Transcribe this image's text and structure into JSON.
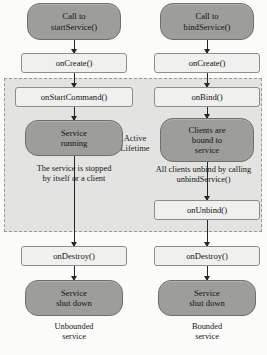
{
  "diagram": {
    "active_lifetime_label": "Active\nLifetime",
    "active_lifetime_line1": "Active",
    "active_lifetime_line2": "Lifetime",
    "colors": {
      "rounded_node_fill": "#9d9d9a",
      "rounded_node_stroke": "#6e6e6b",
      "box_node_fill": "#f0f0ee",
      "box_node_stroke": "#8d8d89",
      "panel_fill": "#e3e3e1",
      "panel_stroke": "#9a9a96",
      "arrow_color": "#262626",
      "text_color": "#151515",
      "background": "#fbfbfa"
    }
  },
  "unbounded_column": {
    "caption_line1": "Unbounded",
    "caption_line2": "service",
    "start_line1": "Call to",
    "start_line2": "startService()",
    "on_create": "onCreate()",
    "on_start_command": "onStartCommand()",
    "running_line1": "Service",
    "running_line2": "running",
    "stopped_note_line1": "The service is stopped",
    "stopped_note_line2": "by itself or a client",
    "on_destroy": "onDestroy()",
    "shutdown_line1": "Service",
    "shutdown_line2": "shut down"
  },
  "bounded_column": {
    "caption_line1": "Bounded",
    "caption_line2": "service",
    "start_line1": "Call to",
    "start_line2": "bindService()",
    "on_create": "onCreate()",
    "on_bind": "onBind()",
    "bound_line1": "Clients are",
    "bound_line2": "bound to",
    "bound_line3": "service",
    "unbind_note_line1": "All clients unbind by calling",
    "unbind_note_line2": "unbindService()",
    "on_unbind": "onUnbind()",
    "on_destroy": "onDestroy()",
    "shutdown_line1": "Service",
    "shutdown_line2": "shut down"
  }
}
